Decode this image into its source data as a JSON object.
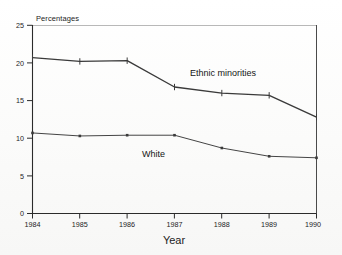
{
  "chart_data": {
    "type": "line",
    "title": "",
    "xlabel": "Year",
    "ylabel": "Percentages",
    "categories": [
      "1984",
      "1985",
      "1986",
      "1987",
      "1988",
      "1989",
      "1990"
    ],
    "x": [
      1984,
      1985,
      1986,
      1987,
      1988,
      1989,
      1990
    ],
    "ylim": [
      0,
      25
    ],
    "yticks": [
      0,
      5,
      10,
      15,
      20,
      25
    ],
    "grid": false,
    "legend_position": "inline-annotations",
    "series": [
      {
        "name": "Ethnic minorities",
        "values": [
          20.7,
          20.2,
          20.3,
          16.8,
          16.0,
          15.7,
          12.8
        ]
      },
      {
        "name": "White",
        "values": [
          10.7,
          10.3,
          10.4,
          10.4,
          8.7,
          7.6,
          7.4
        ]
      }
    ],
    "annotations": [
      {
        "text": "Ethnic minorities",
        "series": "Ethnic minorities"
      },
      {
        "text": "White",
        "series": "White"
      }
    ]
  },
  "axes": {
    "y_axis_title": "Percentages",
    "x_axis_title": "Year",
    "y_tick_labels": [
      "0",
      "5",
      "10",
      "15",
      "20",
      "25"
    ],
    "x_tick_labels": [
      "1984",
      "1985",
      "1986",
      "1987",
      "1988",
      "1989",
      "1990"
    ]
  },
  "labels": {
    "ethnic_minorities": "Ethnic minorities",
    "white": "White"
  },
  "colors": {
    "line": "#3a3a3a",
    "axis": "#2b2b2b",
    "background": "#fdfdfc",
    "text": "#1a1a1a"
  }
}
